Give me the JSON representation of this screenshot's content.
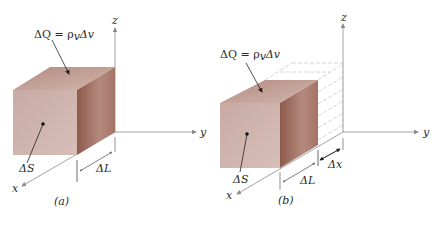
{
  "figure_a": {
    "caption": "(a)",
    "charge_label": "ΔQ = ρ",
    "charge_sub": "v",
    "charge_tail": "Δv",
    "surface_label": "ΔS",
    "length_label": "ΔL",
    "axes": {
      "x": "x",
      "y": "y",
      "z": "z"
    }
  },
  "figure_b": {
    "caption": "(b)",
    "charge_label": "ΔQ = ρ",
    "charge_sub": "v",
    "charge_tail": "Δv",
    "surface_label": "ΔS",
    "length_label": "ΔL",
    "displacement_label": "Δx",
    "axes": {
      "x": "x",
      "y": "y",
      "z": "z"
    }
  },
  "colors": {
    "front_face": "#c9aaa2",
    "top_face": "#b99189",
    "side_face": "#9a685c",
    "axis": "#8a8a8a",
    "dashed": "#b8b8b8"
  }
}
